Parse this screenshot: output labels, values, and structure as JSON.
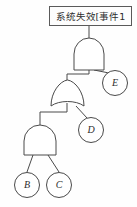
{
  "diagram": {
    "type": "fault-tree",
    "title_box": {
      "text": "系统失效[事件1",
      "x": 49,
      "y": 6,
      "width": 83,
      "height": 20
    },
    "gates": [
      {
        "id": "gate-top",
        "kind": "AND",
        "x": 74,
        "y": 38,
        "width": 30,
        "height": 32,
        "inputs": [
          "gate-middle",
          "event-e"
        ],
        "output_to": "title-box"
      },
      {
        "id": "gate-middle",
        "kind": "OR",
        "x": 51,
        "y": 80,
        "width": 33,
        "height": 28,
        "inputs": [
          "gate-bottom",
          "event-d"
        ],
        "output_to": "gate-top"
      },
      {
        "id": "gate-bottom",
        "kind": "AND",
        "x": 24,
        "y": 125,
        "width": 32,
        "height": 30,
        "inputs": [
          "event-b",
          "event-c"
        ],
        "output_to": "gate-middle"
      }
    ],
    "events": [
      {
        "id": "event-e",
        "label": "E",
        "cx": 115,
        "cy": 83,
        "r": 13
      },
      {
        "id": "event-d",
        "label": "D",
        "cx": 91,
        "cy": 130,
        "r": 13
      },
      {
        "id": "event-b",
        "label": "B",
        "cx": 27,
        "cy": 185,
        "r": 13
      },
      {
        "id": "event-c",
        "label": "C",
        "cx": 59,
        "cy": 185,
        "r": 13
      }
    ],
    "colors": {
      "stroke": "#4a4a4a",
      "box_stroke": "#5a5a5a",
      "text": "#2d2d2d",
      "background": "#fefefe"
    }
  }
}
